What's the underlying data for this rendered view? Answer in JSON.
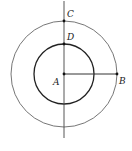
{
  "diagram": {
    "type": "concentric-circles-geometry",
    "center": {
      "label": "A",
      "x": 64,
      "y": 74
    },
    "outer_circle": {
      "r": 53,
      "stroke": "#666666",
      "width": 0.9
    },
    "inner_circle": {
      "r": 30,
      "stroke": "#222222",
      "width": 1.3
    },
    "vertical_line": {
      "x": 64,
      "y1": 1,
      "y2": 138,
      "stroke": "#444444"
    },
    "segment_AB": {
      "x1": 64,
      "y1": 74,
      "x2": 117,
      "y2": 74,
      "stroke": "#333333"
    },
    "points": [
      {
        "label": "A",
        "x": 64,
        "y": 74,
        "label_x": 53,
        "label_y": 85
      },
      {
        "label": "B",
        "x": 117,
        "y": 74,
        "label_x": 119,
        "label_y": 84
      },
      {
        "label": "C",
        "x": 64,
        "y": 21,
        "label_x": 67,
        "label_y": 17
      },
      {
        "label": "D",
        "x": 64,
        "y": 44,
        "label_x": 67,
        "label_y": 40
      }
    ]
  }
}
